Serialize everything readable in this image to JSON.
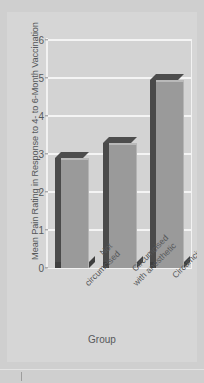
{
  "chart_data": {
    "type": "bar",
    "title": "",
    "xlabel": "Group",
    "ylabel": "Mean Pain Rating in Response to 4- to 6-Month Vaccination",
    "categories": [
      "Not circumcised",
      "Circumcised with anesthetic",
      "Circumcised without anesthetic"
    ],
    "category_lines": [
      [
        "Not",
        "circumcised"
      ],
      [
        "Circumcised",
        "with anesthetic"
      ],
      [
        "Circumcised without",
        "anesthetic"
      ]
    ],
    "values": [
      2.9,
      3.3,
      4.95
    ],
    "ylim": [
      0,
      6
    ],
    "yticks": [
      0,
      1,
      2,
      3,
      4,
      5,
      6
    ],
    "ytick_labels": [
      "0",
      "1",
      "2",
      "3",
      "4",
      "5",
      "6"
    ],
    "grid": true,
    "legend": "none",
    "style": "3d-bar",
    "colors": {
      "figure_background": "#d6d6d6",
      "plot_background": "#d3d3d3",
      "gridline": "#f4f4f4",
      "bar_front": "#9a9a9a",
      "bar_side": "#4a4a4a",
      "bar_shadow": "#3f3f3f",
      "text": "#56595b"
    }
  }
}
